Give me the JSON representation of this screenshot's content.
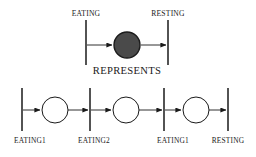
{
  "figure": {
    "caption_middle": "REPRESENTS",
    "stroke_color": "#1a1a1a",
    "background_color": "#ffffff",
    "filled_place_color": "#4a4a4a",
    "empty_place_color": "#ffffff"
  },
  "abstract_net": {
    "transitions": [
      {
        "label": "EATING",
        "x": 86,
        "y_top": 20,
        "y_bottom": 65,
        "label_x": 86,
        "label_y": 10
      },
      {
        "label": "RESTING",
        "x": 168,
        "y_top": 20,
        "y_bottom": 65,
        "label_x": 168,
        "label_y": 10
      }
    ],
    "places": [
      {
        "id": "abstract-place",
        "x": 127,
        "y": 45,
        "r": 13,
        "filled": true,
        "tokens": 0
      }
    ],
    "arcs": [
      {
        "from": "EATING",
        "to": "abstract-place",
        "x1": 87,
        "x2": 113,
        "y": 45
      },
      {
        "from": "abstract-place",
        "to": "RESTING",
        "x1": 141,
        "x2": 167,
        "y": 45
      }
    ]
  },
  "refined_net": {
    "transitions": [
      {
        "label": "EATING1",
        "x": 22,
        "y_top": 88,
        "y_bottom": 131,
        "label_x": 30,
        "label_y": 137
      },
      {
        "label": "EATING2",
        "x": 90,
        "y_top": 88,
        "y_bottom": 131,
        "label_x": 94,
        "label_y": 137
      },
      {
        "label": "EATING1",
        "x": 164,
        "y_top": 88,
        "y_bottom": 131,
        "label_x": 173,
        "label_y": 137
      },
      {
        "label": "RESTING",
        "x": 228,
        "y_top": 88,
        "y_bottom": 131,
        "label_x": 228,
        "label_y": 137
      }
    ],
    "places": [
      {
        "id": "place-1",
        "x": 55,
        "y": 110,
        "r": 13,
        "filled": false,
        "tokens": 0
      },
      {
        "id": "place-2",
        "x": 126,
        "y": 110,
        "r": 13,
        "filled": false,
        "tokens": 0
      },
      {
        "id": "place-3",
        "x": 196,
        "y": 110,
        "r": 13,
        "filled": false,
        "tokens": 0
      }
    ],
    "arcs": [
      {
        "from": "EATING1",
        "to": "place-1",
        "x1": 23,
        "x2": 41,
        "y": 110
      },
      {
        "from": "place-1",
        "to": "EATING2",
        "x1": 68,
        "x2": 89,
        "y": 110
      },
      {
        "from": "EATING2",
        "to": "place-2",
        "x1": 91,
        "x2": 112,
        "y": 110
      },
      {
        "from": "place-2",
        "to": "EATING1",
        "x1": 139,
        "x2": 163,
        "y": 110
      },
      {
        "from": "EATING1",
        "to": "place-3",
        "x1": 165,
        "x2": 182,
        "y": 110
      },
      {
        "from": "place-3",
        "to": "RESTING",
        "x1": 209,
        "x2": 227,
        "y": 110
      }
    ]
  }
}
